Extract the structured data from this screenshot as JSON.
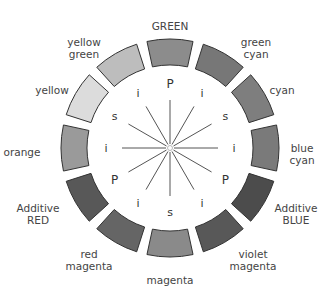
{
  "diagram": {
    "type": "color-wheel",
    "center": [
      170,
      148
    ],
    "segments": [
      {
        "label": "GREEN",
        "fill": "#8c8c8c",
        "angle": 0,
        "label_pos": [
          170,
          26
        ]
      },
      {
        "label": "green\ncyan",
        "fill": "#777777",
        "angle": 30,
        "label_pos": [
          256,
          48
        ]
      },
      {
        "label": "cyan",
        "fill": "#7e7e7e",
        "angle": 60,
        "label_pos": [
          282,
          90
        ]
      },
      {
        "label": "blue\ncyan",
        "fill": "#7a7a7a",
        "angle": 90,
        "label_pos": [
          302,
          154
        ]
      },
      {
        "label": "Additive\nBLUE",
        "fill": "#4c4c4c",
        "angle": 120,
        "label_pos": [
          296,
          214
        ]
      },
      {
        "label": "violet\nmagenta",
        "fill": "#585858",
        "angle": 150,
        "label_pos": [
          253,
          260
        ]
      },
      {
        "label": "magenta",
        "fill": "#8a8a8a",
        "angle": 180,
        "label_pos": [
          170,
          280
        ]
      },
      {
        "label": "red\nmagenta",
        "fill": "#656565",
        "angle": 210,
        "label_pos": [
          89,
          260
        ]
      },
      {
        "label": "Additive\nRED",
        "fill": "#585858",
        "angle": 240,
        "label_pos": [
          38,
          214
        ]
      },
      {
        "label": "orange",
        "fill": "#9a9a9a",
        "angle": 270,
        "label_pos": [
          22,
          152
        ]
      },
      {
        "label": "yellow",
        "fill": "#dcdcdc",
        "angle": 300,
        "label_pos": [
          52,
          90
        ]
      },
      {
        "label": "yellow\ngreen",
        "fill": "#bdbdbd",
        "angle": 330,
        "label_pos": [
          84,
          48
        ]
      }
    ],
    "inner_labels": [
      {
        "text": "P",
        "angle": 0
      },
      {
        "text": "i",
        "angle": 30
      },
      {
        "text": "s",
        "angle": 60
      },
      {
        "text": "i",
        "angle": 90
      },
      {
        "text": "P",
        "angle": 120
      },
      {
        "text": "i",
        "angle": 150
      },
      {
        "text": "s",
        "angle": 180
      },
      {
        "text": "i",
        "angle": 210
      },
      {
        "text": "P",
        "angle": 240
      },
      {
        "text": "i",
        "angle": 270
      },
      {
        "text": "s",
        "angle": 300
      },
      {
        "text": "i",
        "angle": 330
      }
    ],
    "outer_radius": 109,
    "inner_radius": 83,
    "inner_label_radius": 64,
    "spoke_inner": 4,
    "spoke_outer": 48,
    "segment_stroke": "#333333",
    "spoke_color": "#555555"
  }
}
